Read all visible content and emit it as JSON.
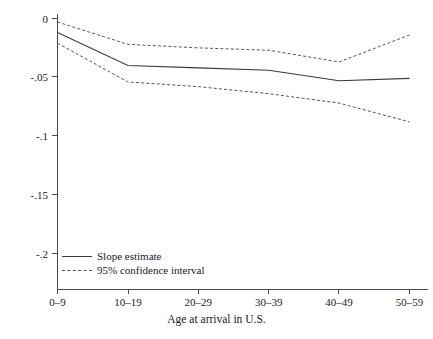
{
  "chart_data": {
    "type": "line",
    "title": "",
    "xlabel": "Age at arrival in U.S.",
    "ylabel": "",
    "categories": [
      "0–9",
      "10–19",
      "20–29",
      "30–39",
      "40–49",
      "50–59"
    ],
    "x": [
      0,
      1,
      2,
      3,
      4,
      5
    ],
    "ylim": [
      -0.2,
      0.0
    ],
    "yticks": [
      0,
      -0.05,
      -0.1,
      -0.15,
      -0.2
    ],
    "ytick_labels": [
      "0",
      "-.05",
      "-.1",
      "-.15",
      "-.2"
    ],
    "grid": false,
    "legend_position": "bottom-left-inside",
    "series": [
      {
        "name": "Slope estimate",
        "style": "solid",
        "color": "#3a3a3a",
        "values": [
          -0.012,
          -0.04,
          -0.042,
          -0.044,
          -0.053,
          -0.051
        ]
      },
      {
        "name": "95% confidence interval upper",
        "style": "dashed",
        "color": "#555555",
        "values": [
          -0.003,
          -0.022,
          -0.025,
          -0.027,
          -0.037,
          -0.014
        ]
      },
      {
        "name": "95% confidence interval lower",
        "style": "dashed",
        "color": "#555555",
        "values": [
          -0.021,
          -0.054,
          -0.058,
          -0.064,
          -0.072,
          -0.088
        ]
      }
    ]
  },
  "axes": {
    "y_tick_labels": [
      "0",
      "-.05",
      "-.1",
      "-.15",
      "-.2"
    ],
    "x_tick_labels": [
      "0–9",
      "10–19",
      "20–29",
      "30–39",
      "40–49",
      "50–59"
    ],
    "x_axis_title": "Age at arrival in U.S."
  },
  "legend": {
    "entries": [
      {
        "label": "Slope estimate",
        "style": "solid"
      },
      {
        "label": "95% confidence interval",
        "style": "dashed"
      }
    ]
  },
  "colors": {
    "background": "#ffffff",
    "axis": "#4a4a4a",
    "estimate_line": "#3a3a3a",
    "confidence_line": "#555555",
    "text": "#1a1a1a"
  }
}
